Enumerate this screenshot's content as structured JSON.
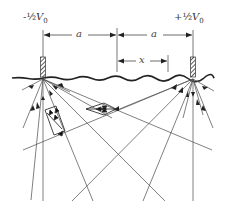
{
  "figure": {
    "electrodes": [
      {
        "name": "left-electrode",
        "potential_label": "-½V₀",
        "sign": "-",
        "frac": "½",
        "var": "V",
        "sub": "0"
      },
      {
        "name": "right-electrode",
        "potential_label": "+½V₀",
        "sign": "+",
        "frac": "½",
        "var": "V",
        "sub": "0"
      }
    ],
    "dimensions": {
      "left_half_spacing": "a",
      "right_half_spacing": "a",
      "offset": "x"
    },
    "colors": {
      "line": "#555555",
      "ground": "#222222",
      "hatch": "#444444"
    }
  }
}
